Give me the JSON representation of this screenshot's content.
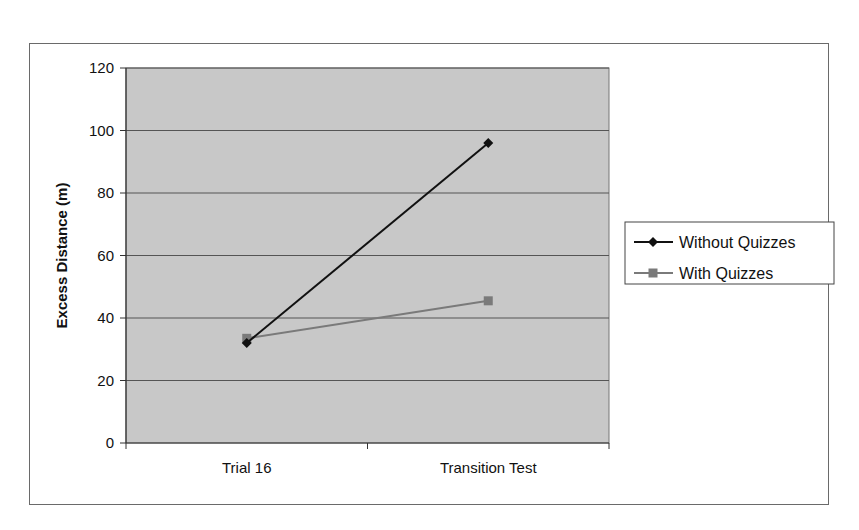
{
  "chart_data": {
    "type": "line",
    "title": "",
    "xlabel": "",
    "ylabel": "Excess Distance (m)",
    "categories": [
      "Trial 16",
      "Transition Test"
    ],
    "series": [
      {
        "name": "Without Quizzes",
        "values": [
          32,
          96
        ],
        "color": "#111111",
        "marker": "diamond"
      },
      {
        "name": "With Quizzes",
        "values": [
          33.5,
          45.5
        ],
        "color": "#7a7a7a",
        "marker": "square"
      }
    ],
    "ylim": [
      0,
      120
    ],
    "yticks": [
      0,
      20,
      40,
      60,
      80,
      100,
      120
    ],
    "grid": true,
    "legend_position": "right",
    "plot_background": "#c8c8c8"
  }
}
